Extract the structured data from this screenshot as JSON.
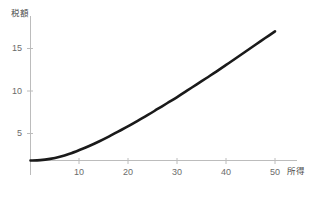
{
  "chart_data": {
    "type": "line",
    "title": "",
    "subtitle": "",
    "xlabel": "所得",
    "ylabel": "税額",
    "xlim": [
      0,
      52
    ],
    "ylim": [
      0,
      18.2
    ],
    "grid": false,
    "legend": null,
    "xticks": [
      10,
      20,
      30,
      40,
      50
    ],
    "xtick_labels": [
      "10",
      "20",
      "30",
      "40",
      "50"
    ],
    "yticks": [
      5,
      10,
      15
    ],
    "ytick_labels": [
      "5",
      "10",
      "15"
    ],
    "line_color": "#1a1a1a",
    "line_width": 2.6,
    "axis_color": "#b9b9b9",
    "background": "#ffffff",
    "series": [
      {
        "name": "税額",
        "x": [
          0,
          2,
          4,
          6,
          8,
          10,
          12,
          14,
          16,
          18,
          20,
          22,
          24,
          26,
          28,
          30,
          32,
          34,
          36,
          38,
          40,
          42,
          44,
          46,
          48,
          50
        ],
        "values": [
          0,
          0.05,
          0.22,
          0.5,
          0.9,
          1.4,
          1.95,
          2.55,
          3.2,
          3.9,
          4.6,
          5.35,
          6.1,
          6.9,
          7.7,
          8.5,
          9.35,
          10.2,
          11.05,
          11.9,
          12.8,
          13.7,
          14.6,
          15.5,
          16.4,
          17.3
        ]
      }
    ]
  },
  "axes": {
    "y_axis_name": "税額",
    "x_axis_name": "所得"
  }
}
